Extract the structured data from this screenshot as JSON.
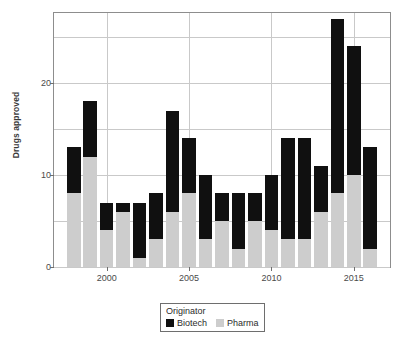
{
  "chart_data": {
    "type": "bar",
    "stacked": true,
    "title": "",
    "xlabel": "",
    "ylabel": "Drugs approved",
    "grid": true,
    "legend_position": "bottom",
    "legend_title": "Originator",
    "categories": [
      1998,
      1999,
      2000,
      2001,
      2002,
      2003,
      2004,
      2005,
      2006,
      2007,
      2008,
      2009,
      2010,
      2011,
      2012,
      2013,
      2014,
      2015,
      2016
    ],
    "x_tick_labels": [
      "2000",
      "2005",
      "2010",
      "2015"
    ],
    "x_tick_values": [
      2000,
      2005,
      2010,
      2015
    ],
    "xlim": [
      1996.8,
      2017.2
    ],
    "y_tick_labels": [
      "0",
      "10",
      "20"
    ],
    "y_tick_values": [
      0,
      10,
      20
    ],
    "ylim": [
      0,
      27.6
    ],
    "series": [
      {
        "name": "Pharma",
        "color": "#cdcdcd",
        "values": [
          8,
          12,
          4,
          6,
          1,
          3,
          6,
          8,
          3,
          5,
          2,
          5,
          4,
          3,
          3,
          6,
          8,
          10,
          2
        ]
      },
      {
        "name": "Biotech",
        "color": "#101010",
        "values": [
          5,
          6,
          3,
          1,
          6,
          5,
          11,
          6,
          7,
          3,
          6,
          3,
          6,
          11,
          11,
          5,
          19,
          14,
          11
        ]
      }
    ],
    "totals": [
      13,
      18,
      7,
      7,
      7,
      8,
      17,
      14,
      10,
      8,
      8,
      8,
      10,
      14,
      14,
      11,
      27,
      24,
      13
    ]
  },
  "legend": {
    "title": "Originator",
    "entries": [
      {
        "label": "Biotech",
        "color": "#101010"
      },
      {
        "label": "Pharma",
        "color": "#cdcdcd"
      }
    ]
  },
  "axes": {
    "y_title": "Drugs approved"
  }
}
